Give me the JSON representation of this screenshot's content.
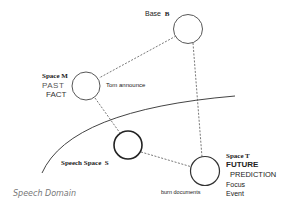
{
  "diagram": {
    "spaces": {
      "base": {
        "label": "Base",
        "letter": "B"
      },
      "m": {
        "label": "Space M",
        "line1": "PAST",
        "line2": "FACT",
        "content": "Tom announce"
      },
      "s": {
        "label": "Speech Space",
        "letter": "S"
      },
      "t": {
        "label": "Space T",
        "line1": "FUTURE",
        "line2": "PREDICTION",
        "line3": "Focus",
        "line4": "Event",
        "content": "burn documents"
      }
    },
    "domain_label": "Speech Domain",
    "connections": [
      {
        "from": "Base B",
        "to": "Space M",
        "style": "dashed"
      },
      {
        "from": "Base B",
        "to": "Space T",
        "style": "dashed"
      },
      {
        "from": "Space M",
        "to": "Speech Space S",
        "style": "dashed"
      },
      {
        "from": "Speech Space S",
        "to": "Space T",
        "style": "dashed"
      }
    ],
    "colors": {
      "stroke": "#333333",
      "dashed": "#555555",
      "domain_text": "#777777"
    }
  }
}
